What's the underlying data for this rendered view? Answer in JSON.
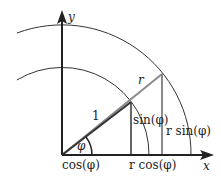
{
  "diagram": {
    "axes": {
      "x_label": "x",
      "y_label": "y"
    },
    "labels": {
      "y_axis": "y",
      "x_axis": "x",
      "unit_hyp": "1",
      "r_hyp": "r",
      "phi": "φ",
      "cos": "cos(φ)",
      "sin": "sin(φ)",
      "rcos": "r cos(φ)",
      "rsin": "r sin(φ)"
    },
    "colors": {
      "stroke": "#222222",
      "gray_line": "#8a8a8a",
      "background": "#ffffff"
    }
  }
}
